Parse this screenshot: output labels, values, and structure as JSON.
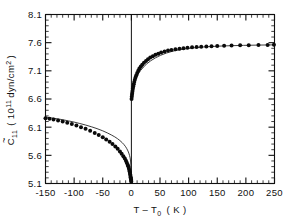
{
  "chart_data": {
    "type": "scatter",
    "title": "",
    "xlabel": "T - T0  (K)",
    "xlabel_parts": {
      "lead": "T – T",
      "sub": "0",
      "unit": "( K )"
    },
    "ylabel": "C11 (10^11 dyn/cm^2)",
    "ylabel_parts": {
      "sym": "C",
      "sym_sub": "11",
      "open": "( 10",
      "exp": "11",
      "unit": "dyn/cm",
      "unit_exp": "2",
      "close": ")"
    },
    "xlim": [
      -150,
      250
    ],
    "ylim": [
      5.1,
      8.1
    ],
    "xticks": [
      -150,
      -100,
      -50,
      0,
      50,
      100,
      150,
      200,
      250
    ],
    "xtick_labels": [
      "-150",
      "-100",
      "-50",
      "0",
      "50",
      "100",
      "150",
      "200",
      "250"
    ],
    "yticks": [
      5.1,
      5.6,
      6.1,
      6.6,
      7.1,
      7.6,
      8.1
    ],
    "ytick_labels": [
      "5.1",
      "5.6",
      "6.1",
      "6.6",
      "7.1",
      "7.6",
      "8.1"
    ],
    "x_minor_interval": 10,
    "y_minor_interval": 0.1,
    "grid": false,
    "legend": null,
    "tick_direction": "in",
    "vertical_marker_x": 0,
    "series": [
      {
        "name": "measured C11 (T < T0 branch)",
        "marker": "filled-circle",
        "x": [
          -150,
          -143,
          -136,
          -128,
          -120,
          -112,
          -104,
          -96,
          -88,
          -80,
          -72,
          -64,
          -57,
          -50,
          -44,
          -38,
          -33,
          -28,
          -24,
          -20,
          -17,
          -14,
          -11.5,
          -9.5,
          -8,
          -6.5,
          -5.5,
          -4.5,
          -3.8,
          -3.1,
          -2.5,
          -2.0,
          -1.6,
          -1.2,
          -0.9,
          -0.6,
          -0.35,
          -0.15
        ],
        "y": [
          6.26,
          6.25,
          6.235,
          6.22,
          6.2,
          6.18,
          6.155,
          6.13,
          6.1,
          6.07,
          6.035,
          5.995,
          5.96,
          5.92,
          5.88,
          5.84,
          5.8,
          5.755,
          5.715,
          5.67,
          5.63,
          5.585,
          5.545,
          5.505,
          5.47,
          5.435,
          5.405,
          5.375,
          5.345,
          5.315,
          5.285,
          5.26,
          5.235,
          5.21,
          5.19,
          5.17,
          5.15,
          5.13
        ]
      },
      {
        "name": "measured C11 (T > T0 branch)",
        "marker": "filled-circle",
        "x": [
          0.3,
          0.7,
          1.1,
          1.5,
          2.0,
          2.6,
          3.3,
          4.1,
          5.0,
          6.0,
          7.2,
          8.6,
          10.2,
          12,
          14,
          16.5,
          19,
          22,
          25.5,
          29,
          33,
          37.5,
          42,
          47,
          52,
          58,
          64,
          70,
          77,
          84,
          91,
          98,
          106,
          114,
          122,
          131,
          140,
          150,
          162,
          175,
          190,
          205,
          222,
          238,
          249
        ],
        "y": [
          6.6,
          6.64,
          6.675,
          6.705,
          6.74,
          6.78,
          6.82,
          6.86,
          6.9,
          6.94,
          6.98,
          7.02,
          7.06,
          7.1,
          7.14,
          7.175,
          7.21,
          7.245,
          7.275,
          7.305,
          7.335,
          7.36,
          7.385,
          7.405,
          7.425,
          7.445,
          7.46,
          7.472,
          7.484,
          7.494,
          7.503,
          7.51,
          7.517,
          7.523,
          7.528,
          7.533,
          7.537,
          7.541,
          7.545,
          7.549,
          7.552,
          7.555,
          7.558,
          7.56,
          7.561
        ]
      }
    ],
    "fits": [
      {
        "name": "theory fit (T < T0)",
        "style": "solid-thin",
        "x": [
          -150,
          -140,
          -130,
          -120,
          -110,
          -100,
          -90,
          -80,
          -70,
          -60,
          -50,
          -42,
          -35,
          -29,
          -24,
          -20,
          -16,
          -13,
          -10,
          -8,
          -6,
          -4.5,
          -3.2,
          -2.2,
          -1.4,
          -0.8,
          -0.4,
          -0.15,
          -0.02
        ],
        "y": [
          6.28,
          6.265,
          6.25,
          6.232,
          6.212,
          6.19,
          6.165,
          6.138,
          6.108,
          6.074,
          6.035,
          5.998,
          5.962,
          5.928,
          5.894,
          5.862,
          5.825,
          5.792,
          5.752,
          5.718,
          5.678,
          5.64,
          5.598,
          5.555,
          5.5,
          5.43,
          5.35,
          5.25,
          5.12
        ]
      },
      {
        "name": "theory fit (T > T0)",
        "style": "solid-thin",
        "x": [
          0.2,
          0.6,
          1.2,
          2,
          3,
          4.5,
          6.5,
          9,
          12,
          16,
          21,
          27,
          34,
          42,
          51,
          61,
          72,
          84,
          97,
          111,
          126,
          142,
          159,
          177,
          196,
          216,
          235,
          250
        ],
        "y": [
          6.58,
          6.635,
          6.69,
          6.745,
          6.805,
          6.865,
          6.925,
          6.985,
          7.045,
          7.105,
          7.165,
          7.225,
          7.28,
          7.33,
          7.375,
          7.415,
          7.448,
          7.474,
          7.494,
          7.51,
          7.523,
          7.533,
          7.541,
          7.547,
          7.552,
          7.556,
          7.559,
          7.561
        ]
      }
    ]
  },
  "figure": {
    "background_color": "#ffffff",
    "line_color": "#101010",
    "marker_color": "#0a0a0a"
  }
}
